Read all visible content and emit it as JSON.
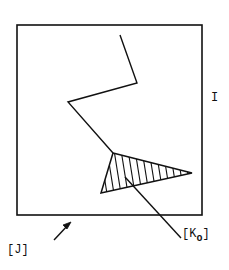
{
  "diagram": {
    "labels": {
      "I": "I",
      "J": "[J]",
      "K_base": "[K",
      "K_sub": "o",
      "K_close": "]"
    },
    "colors": {
      "stroke": "#111111",
      "background": "#ffffff"
    },
    "shapes": {
      "frame": {
        "x": 17,
        "y": 25,
        "width": 185,
        "height": 190
      },
      "zigzag": [
        [
          120,
          35
        ],
        [
          137,
          83
        ],
        [
          68,
          102
        ],
        [
          113,
          153
        ]
      ],
      "triangle": [
        [
          113,
          153
        ],
        [
          192,
          173
        ],
        [
          101,
          193
        ]
      ],
      "pointer_line": [
        [
          125,
          177
        ],
        [
          181,
          238
        ]
      ],
      "arrow": [
        [
          54,
          240
        ],
        [
          70,
          223
        ]
      ]
    }
  }
}
